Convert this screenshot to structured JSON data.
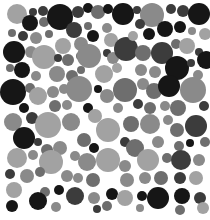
{
  "image": {
    "description": "Grayscale circle-packing dot plate (Ishihara-style color-vision test pattern)",
    "background": "#ffffff",
    "width": 210,
    "height": 220
  },
  "palette": {
    "black": "#161616",
    "dark": "#3c3c3c",
    "mid": "#6e6e6e",
    "gray": "#8a8a8a",
    "light": "#a2a2a2"
  },
  "circles": [
    {
      "cx": 17,
      "cy": 14,
      "r": 10,
      "tone": "light"
    },
    {
      "cx": 33,
      "cy": 12,
      "r": 4,
      "tone": "dark"
    },
    {
      "cx": 43,
      "cy": 11,
      "r": 5,
      "tone": "dark"
    },
    {
      "cx": 30,
      "cy": 23,
      "r": 8,
      "tone": "black"
    },
    {
      "cx": 44,
      "cy": 22,
      "r": 5,
      "tone": "mid"
    },
    {
      "cx": 60,
      "cy": 17,
      "r": 13,
      "tone": "black"
    },
    {
      "cx": 78,
      "cy": 12,
      "r": 6,
      "tone": "dark"
    },
    {
      "cx": 88,
      "cy": 8,
      "r": 5,
      "tone": "black"
    },
    {
      "cx": 98,
      "cy": 12,
      "r": 7,
      "tone": "mid"
    },
    {
      "cx": 108,
      "cy": 9,
      "r": 5,
      "tone": "black"
    },
    {
      "cx": 123,
      "cy": 14,
      "r": 11,
      "tone": "black"
    },
    {
      "cx": 137,
      "cy": 10,
      "r": 4,
      "tone": "dark"
    },
    {
      "cx": 152,
      "cy": 15,
      "r": 12,
      "tone": "gray"
    },
    {
      "cx": 171,
      "cy": 9,
      "r": 5,
      "tone": "dark"
    },
    {
      "cx": 183,
      "cy": 11,
      "r": 6,
      "tone": "dark"
    },
    {
      "cx": 199,
      "cy": 14,
      "r": 11,
      "tone": "black"
    },
    {
      "cx": 12,
      "cy": 33,
      "r": 4,
      "tone": "mid"
    },
    {
      "cx": 23,
      "cy": 36,
      "r": 5,
      "tone": "dark"
    },
    {
      "cx": 36,
      "cy": 38,
      "r": 6,
      "tone": "gray"
    },
    {
      "cx": 49,
      "cy": 34,
      "r": 4,
      "tone": "mid"
    },
    {
      "cx": 74,
      "cy": 30,
      "r": 8,
      "tone": "dark"
    },
    {
      "cx": 88,
      "cy": 26,
      "r": 4,
      "tone": "mid"
    },
    {
      "cx": 93,
      "cy": 36,
      "r": 6,
      "tone": "black"
    },
    {
      "cx": 107,
      "cy": 28,
      "r": 5,
      "tone": "gray"
    },
    {
      "cx": 111,
      "cy": 40,
      "r": 7,
      "tone": "light"
    },
    {
      "cx": 140,
      "cy": 24,
      "r": 5,
      "tone": "dark"
    },
    {
      "cx": 149,
      "cy": 34,
      "r": 6,
      "tone": "black"
    },
    {
      "cx": 165,
      "cy": 29,
      "r": 8,
      "tone": "black"
    },
    {
      "cx": 180,
      "cy": 27,
      "r": 6,
      "tone": "black"
    },
    {
      "cx": 192,
      "cy": 31,
      "r": 4,
      "tone": "gray"
    },
    {
      "cx": 205,
      "cy": 34,
      "r": 6,
      "tone": "light"
    },
    {
      "cx": 14,
      "cy": 52,
      "r": 11,
      "tone": "black"
    },
    {
      "cx": 31,
      "cy": 52,
      "r": 6,
      "tone": "gray"
    },
    {
      "cx": 44,
      "cy": 57,
      "r": 12,
      "tone": "light"
    },
    {
      "cx": 63,
      "cy": 46,
      "r": 8,
      "tone": "light"
    },
    {
      "cx": 58,
      "cy": 58,
      "r": 4,
      "tone": "dark"
    },
    {
      "cx": 68,
      "cy": 60,
      "r": 6,
      "tone": "mid"
    },
    {
      "cx": 81,
      "cy": 44,
      "r": 7,
      "tone": "gray"
    },
    {
      "cx": 80,
      "cy": 56,
      "r": 4,
      "tone": "mid"
    },
    {
      "cx": 89,
      "cy": 56,
      "r": 12,
      "tone": "gray"
    },
    {
      "cx": 107,
      "cy": 53,
      "r": 4,
      "tone": "dark"
    },
    {
      "cx": 113,
      "cy": 58,
      "r": 6,
      "tone": "gray"
    },
    {
      "cx": 126,
      "cy": 49,
      "r": 12,
      "tone": "dark"
    },
    {
      "cx": 133,
      "cy": 36,
      "r": 5,
      "tone": "light"
    },
    {
      "cx": 143,
      "cy": 53,
      "r": 8,
      "tone": "mid"
    },
    {
      "cx": 162,
      "cy": 53,
      "r": 11,
      "tone": "dark"
    },
    {
      "cx": 176,
      "cy": 44,
      "r": 5,
      "tone": "mid"
    },
    {
      "cx": 187,
      "cy": 46,
      "r": 8,
      "tone": "light"
    },
    {
      "cx": 199,
      "cy": 52,
      "r": 4,
      "tone": "dark"
    },
    {
      "cx": 206,
      "cy": 60,
      "r": 9,
      "tone": "black"
    },
    {
      "cx": 10,
      "cy": 68,
      "r": 4,
      "tone": "mid"
    },
    {
      "cx": 22,
      "cy": 70,
      "r": 8,
      "tone": "black"
    },
    {
      "cx": 36,
      "cy": 76,
      "r": 5,
      "tone": "gray"
    },
    {
      "cx": 57,
      "cy": 74,
      "r": 8,
      "tone": "gray"
    },
    {
      "cx": 72,
      "cy": 76,
      "r": 6,
      "tone": "mid"
    },
    {
      "cx": 81,
      "cy": 70,
      "r": 4,
      "tone": "mid"
    },
    {
      "cx": 104,
      "cy": 74,
      "r": 9,
      "tone": "light"
    },
    {
      "cx": 117,
      "cy": 68,
      "r": 5,
      "tone": "light"
    },
    {
      "cx": 141,
      "cy": 70,
      "r": 6,
      "tone": "gray"
    },
    {
      "cx": 155,
      "cy": 72,
      "r": 6,
      "tone": "gray"
    },
    {
      "cx": 177,
      "cy": 68,
      "r": 12,
      "tone": "black"
    },
    {
      "cx": 191,
      "cy": 63,
      "r": 4,
      "tone": "dark"
    },
    {
      "cx": 198,
      "cy": 75,
      "r": 5,
      "tone": "gray"
    },
    {
      "cx": 13,
      "cy": 92,
      "r": 13,
      "tone": "black"
    },
    {
      "cx": 30,
      "cy": 88,
      "r": 5,
      "tone": "mid"
    },
    {
      "cx": 38,
      "cy": 96,
      "r": 9,
      "tone": "light"
    },
    {
      "cx": 53,
      "cy": 92,
      "r": 6,
      "tone": "gray"
    },
    {
      "cx": 64,
      "cy": 89,
      "r": 5,
      "tone": "gray"
    },
    {
      "cx": 79,
      "cy": 89,
      "r": 13,
      "tone": "gray"
    },
    {
      "cx": 98,
      "cy": 89,
      "r": 4,
      "tone": "black"
    },
    {
      "cx": 107,
      "cy": 96,
      "r": 7,
      "tone": "gray"
    },
    {
      "cx": 125,
      "cy": 90,
      "r": 12,
      "tone": "mid"
    },
    {
      "cx": 143,
      "cy": 84,
      "r": 6,
      "tone": "gray"
    },
    {
      "cx": 154,
      "cy": 91,
      "r": 8,
      "tone": "mid"
    },
    {
      "cx": 169,
      "cy": 86,
      "r": 11,
      "tone": "black"
    },
    {
      "cx": 193,
      "cy": 90,
      "r": 13,
      "tone": "gray"
    },
    {
      "cx": 24,
      "cy": 108,
      "r": 5,
      "tone": "black"
    },
    {
      "cx": 55,
      "cy": 106,
      "r": 6,
      "tone": "mid"
    },
    {
      "cx": 67,
      "cy": 105,
      "r": 5,
      "tone": "gray"
    },
    {
      "cx": 88,
      "cy": 108,
      "r": 5,
      "tone": "black"
    },
    {
      "cx": 95,
      "cy": 116,
      "r": 7,
      "tone": "light"
    },
    {
      "cx": 118,
      "cy": 108,
      "r": 5,
      "tone": "gray"
    },
    {
      "cx": 138,
      "cy": 104,
      "r": 5,
      "tone": "dark"
    },
    {
      "cx": 150,
      "cy": 108,
      "r": 6,
      "tone": "mid"
    },
    {
      "cx": 165,
      "cy": 106,
      "r": 5,
      "tone": "gray"
    },
    {
      "cx": 178,
      "cy": 108,
      "r": 8,
      "tone": "mid"
    },
    {
      "cx": 204,
      "cy": 106,
      "r": 5,
      "tone": "dark"
    },
    {
      "cx": 13,
      "cy": 122,
      "r": 9,
      "tone": "gray"
    },
    {
      "cx": 32,
      "cy": 118,
      "r": 6,
      "tone": "dark"
    },
    {
      "cx": 48,
      "cy": 125,
      "r": 13,
      "tone": "light"
    },
    {
      "cx": 71,
      "cy": 122,
      "r": 9,
      "tone": "gray"
    },
    {
      "cx": 108,
      "cy": 130,
      "r": 12,
      "tone": "light"
    },
    {
      "cx": 131,
      "cy": 124,
      "r": 8,
      "tone": "mid"
    },
    {
      "cx": 150,
      "cy": 124,
      "r": 10,
      "tone": "gray"
    },
    {
      "cx": 168,
      "cy": 120,
      "r": 5,
      "tone": "gray"
    },
    {
      "cx": 177,
      "cy": 130,
      "r": 7,
      "tone": "mid"
    },
    {
      "cx": 196,
      "cy": 126,
      "r": 11,
      "tone": "dark"
    },
    {
      "cx": 24,
      "cy": 138,
      "r": 11,
      "tone": "black"
    },
    {
      "cx": 38,
      "cy": 142,
      "r": 4,
      "tone": "dark"
    },
    {
      "cx": 84,
      "cy": 140,
      "r": 7,
      "tone": "mid"
    },
    {
      "cx": 94,
      "cy": 148,
      "r": 5,
      "tone": "black"
    },
    {
      "cx": 125,
      "cy": 142,
      "r": 5,
      "tone": "dark"
    },
    {
      "cx": 135,
      "cy": 148,
      "r": 9,
      "tone": "mid"
    },
    {
      "cx": 158,
      "cy": 142,
      "r": 6,
      "tone": "gray"
    },
    {
      "cx": 179,
      "cy": 146,
      "r": 5,
      "tone": "mid"
    },
    {
      "cx": 190,
      "cy": 143,
      "r": 4,
      "tone": "black"
    },
    {
      "cx": 205,
      "cy": 142,
      "r": 5,
      "tone": "mid"
    },
    {
      "cx": 17,
      "cy": 158,
      "r": 10,
      "tone": "light"
    },
    {
      "cx": 33,
      "cy": 155,
      "r": 5,
      "tone": "gray"
    },
    {
      "cx": 47,
      "cy": 150,
      "r": 6,
      "tone": "mid"
    },
    {
      "cx": 60,
      "cy": 148,
      "r": 7,
      "tone": "gray"
    },
    {
      "cx": 51,
      "cy": 162,
      "r": 12,
      "tone": "light"
    },
    {
      "cx": 75,
      "cy": 156,
      "r": 5,
      "tone": "gray"
    },
    {
      "cx": 87,
      "cy": 162,
      "r": 9,
      "tone": "gray"
    },
    {
      "cx": 108,
      "cy": 160,
      "r": 12,
      "tone": "light"
    },
    {
      "cx": 125,
      "cy": 166,
      "r": 6,
      "tone": "gray"
    },
    {
      "cx": 148,
      "cy": 160,
      "r": 11,
      "tone": "light"
    },
    {
      "cx": 167,
      "cy": 158,
      "r": 5,
      "tone": "mid"
    },
    {
      "cx": 181,
      "cy": 160,
      "r": 10,
      "tone": "dark"
    },
    {
      "cx": 199,
      "cy": 160,
      "r": 6,
      "tone": "gray"
    },
    {
      "cx": 10,
      "cy": 174,
      "r": 5,
      "tone": "dark"
    },
    {
      "cx": 27,
      "cy": 176,
      "r": 7,
      "tone": "gray"
    },
    {
      "cx": 40,
      "cy": 172,
      "r": 5,
      "tone": "mid"
    },
    {
      "cx": 67,
      "cy": 176,
      "r": 6,
      "tone": "gray"
    },
    {
      "cx": 78,
      "cy": 178,
      "r": 5,
      "tone": "gray"
    },
    {
      "cx": 93,
      "cy": 180,
      "r": 7,
      "tone": "mid"
    },
    {
      "cx": 127,
      "cy": 180,
      "r": 7,
      "tone": "gray"
    },
    {
      "cx": 145,
      "cy": 178,
      "r": 6,
      "tone": "gray"
    },
    {
      "cx": 161,
      "cy": 178,
      "r": 7,
      "tone": "mid"
    },
    {
      "cx": 180,
      "cy": 178,
      "r": 6,
      "tone": "dark"
    },
    {
      "cx": 196,
      "cy": 178,
      "r": 7,
      "tone": "light"
    },
    {
      "cx": 14,
      "cy": 190,
      "r": 8,
      "tone": "light"
    },
    {
      "cx": 45,
      "cy": 192,
      "r": 5,
      "tone": "mid"
    },
    {
      "cx": 59,
      "cy": 190,
      "r": 5,
      "tone": "black"
    },
    {
      "cx": 75,
      "cy": 196,
      "r": 9,
      "tone": "dark"
    },
    {
      "cx": 38,
      "cy": 201,
      "r": 9,
      "tone": "black"
    },
    {
      "cx": 94,
      "cy": 198,
      "r": 6,
      "tone": "gray"
    },
    {
      "cx": 112,
      "cy": 194,
      "r": 6,
      "tone": "black"
    },
    {
      "cx": 125,
      "cy": 198,
      "r": 8,
      "tone": "light"
    },
    {
      "cx": 142,
      "cy": 196,
      "r": 5,
      "tone": "black"
    },
    {
      "cx": 158,
      "cy": 198,
      "r": 11,
      "tone": "black"
    },
    {
      "cx": 182,
      "cy": 196,
      "r": 8,
      "tone": "black"
    },
    {
      "cx": 200,
      "cy": 198,
      "r": 6,
      "tone": "dark"
    },
    {
      "cx": 12,
      "cy": 206,
      "r": 6,
      "tone": "black"
    },
    {
      "cx": 56,
      "cy": 207,
      "r": 5,
      "tone": "gray"
    },
    {
      "cx": 97,
      "cy": 209,
      "r": 4,
      "tone": "dark"
    },
    {
      "cx": 107,
      "cy": 206,
      "r": 5,
      "tone": "mid"
    },
    {
      "cx": 140,
      "cy": 208,
      "r": 4,
      "tone": "gray"
    },
    {
      "cx": 180,
      "cy": 210,
      "r": 5,
      "tone": "mid"
    },
    {
      "cx": 203,
      "cy": 208,
      "r": 6,
      "tone": "light"
    }
  ]
}
